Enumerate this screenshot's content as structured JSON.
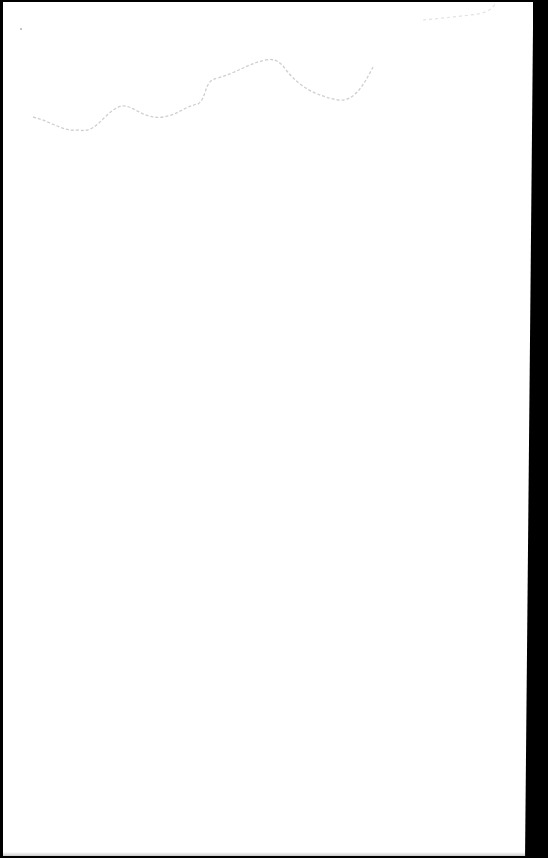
{
  "document": {
    "type": "scanned-blank-page",
    "text_content": "",
    "colors": {
      "paper": "#ffffff",
      "scan_border": "#000000",
      "stain": "#c8c8c8"
    }
  }
}
